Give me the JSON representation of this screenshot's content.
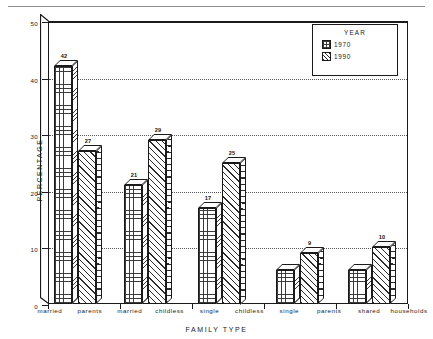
{
  "chart_data": {
    "type": "bar",
    "title": "",
    "xlabel": "FAMILY TYPE",
    "ylabel": "PERCENTAGE",
    "ylim": [
      0,
      50
    ],
    "yticks": [
      "0",
      "10",
      "20",
      "30",
      "40",
      "50"
    ],
    "grid": true,
    "legend_position": "top-right",
    "legend_title": "YEAR",
    "categories": [
      "married parents",
      "married childless",
      "single childless",
      "single parents",
      "shared households"
    ],
    "series": [
      {
        "name": "1970",
        "values": [
          42,
          21,
          17,
          6,
          6
        ],
        "pattern": "grid"
      },
      {
        "name": "1990",
        "values": [
          27,
          29,
          25,
          9,
          10
        ],
        "pattern": "diagonal-hatch"
      }
    ],
    "bar_labels": {
      "1970": [
        "42",
        "21",
        "17",
        "",
        ""
      ],
      "1990": [
        "27",
        "29",
        "25",
        "9",
        "10"
      ]
    }
  },
  "axis": {
    "y_title": "PERCENTAGE",
    "x_title": "FAMILY TYPE",
    "y_tick_labels": [
      "50",
      "40",
      "30",
      "20",
      "10",
      "0"
    ]
  },
  "legend": {
    "title": "YEAR",
    "items": [
      {
        "label": "1970"
      },
      {
        "label": "1990"
      }
    ]
  },
  "x_category_words": [
    {
      "first": "married",
      "second": "parents"
    },
    {
      "first": "married",
      "second": "childless"
    },
    {
      "first": "single",
      "second": "childless"
    },
    {
      "first": "single",
      "second": "parents"
    },
    {
      "first": "shared",
      "second": "households"
    }
  ],
  "colors": {
    "ink": "#1a1a1a",
    "grid": "#555555",
    "background": "#ffffff"
  }
}
